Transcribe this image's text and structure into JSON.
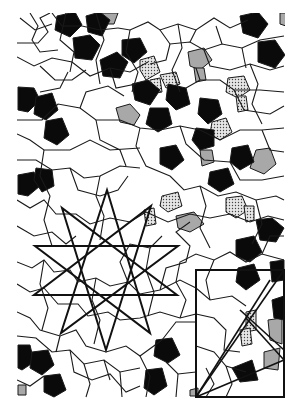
{
  "figure": {
    "kind": "geometric-tiling-diagram",
    "bounds": {
      "x": 17,
      "y": 13,
      "width": 267,
      "height": 384
    },
    "colors": {
      "background": "#ffffff",
      "line": "#1a1a1a",
      "pentagon_fill": "#0a0a0a",
      "gray_fill": "#a8a8a8",
      "dot_fill": "#e6e6e6",
      "dot": "#444444"
    },
    "black_pentagons": [
      [
        [
          57,
          16
        ],
        [
          75,
          12
        ],
        [
          82,
          25
        ],
        [
          70,
          37
        ],
        [
          55,
          30
        ]
      ],
      [
        [
          73,
          38
        ],
        [
          90,
          35
        ],
        [
          100,
          45
        ],
        [
          92,
          60
        ],
        [
          75,
          58
        ]
      ],
      [
        [
          100,
          60
        ],
        [
          117,
          52
        ],
        [
          128,
          62
        ],
        [
          120,
          78
        ],
        [
          103,
          76
        ]
      ],
      [
        [
          122,
          40
        ],
        [
          140,
          38
        ],
        [
          147,
          52
        ],
        [
          134,
          63
        ],
        [
          122,
          55
        ]
      ],
      [
        [
          86,
          16
        ],
        [
          100,
          12
        ],
        [
          110,
          20
        ],
        [
          102,
          36
        ],
        [
          88,
          32
        ]
      ],
      [
        [
          240,
          16
        ],
        [
          258,
          12
        ],
        [
          268,
          24
        ],
        [
          258,
          38
        ],
        [
          243,
          33
        ]
      ],
      [
        [
          258,
          42
        ],
        [
          275,
          40
        ],
        [
          285,
          55
        ],
        [
          275,
          68
        ],
        [
          258,
          62
        ]
      ],
      [
        [
          18,
          87
        ],
        [
          34,
          88
        ],
        [
          40,
          100
        ],
        [
          28,
          112
        ],
        [
          18,
          110
        ]
      ],
      [
        [
          36,
          97
        ],
        [
          52,
          93
        ],
        [
          58,
          110
        ],
        [
          46,
          120
        ],
        [
          34,
          114
        ]
      ],
      [
        [
          46,
          121
        ],
        [
          62,
          118
        ],
        [
          69,
          135
        ],
        [
          57,
          145
        ],
        [
          44,
          138
        ]
      ],
      [
        [
          132,
          84
        ],
        [
          148,
          80
        ],
        [
          160,
          90
        ],
        [
          150,
          105
        ],
        [
          135,
          100
        ]
      ],
      [
        [
          168,
          84
        ],
        [
          186,
          88
        ],
        [
          190,
          104
        ],
        [
          176,
          110
        ],
        [
          166,
          100
        ]
      ],
      [
        [
          150,
          108
        ],
        [
          168,
          108
        ],
        [
          172,
          124
        ],
        [
          158,
          132
        ],
        [
          146,
          124
        ]
      ],
      [
        [
          160,
          148
        ],
        [
          176,
          145
        ],
        [
          184,
          160
        ],
        [
          172,
          170
        ],
        [
          160,
          164
        ]
      ],
      [
        [
          200,
          98
        ],
        [
          218,
          100
        ],
        [
          222,
          114
        ],
        [
          208,
          124
        ],
        [
          198,
          114
        ]
      ],
      [
        [
          196,
          128
        ],
        [
          214,
          130
        ],
        [
          214,
          146
        ],
        [
          200,
          150
        ],
        [
          192,
          140
        ]
      ],
      [
        [
          232,
          148
        ],
        [
          248,
          145
        ],
        [
          254,
          162
        ],
        [
          240,
          170
        ],
        [
          230,
          162
        ]
      ],
      [
        [
          210,
          172
        ],
        [
          228,
          168
        ],
        [
          234,
          184
        ],
        [
          220,
          192
        ],
        [
          208,
          184
        ]
      ],
      [
        [
          18,
          175
        ],
        [
          34,
          172
        ],
        [
          40,
          186
        ],
        [
          28,
          196
        ],
        [
          18,
          194
        ]
      ],
      [
        [
          36,
          168
        ],
        [
          52,
          170
        ],
        [
          54,
          186
        ],
        [
          42,
          192
        ],
        [
          34,
          180
        ]
      ],
      [
        [
          256,
          220
        ],
        [
          272,
          218
        ],
        [
          284,
          228
        ],
        [
          276,
          242
        ],
        [
          260,
          240
        ]
      ],
      [
        [
          236,
          240
        ],
        [
          254,
          236
        ],
        [
          262,
          252
        ],
        [
          250,
          262
        ],
        [
          236,
          256
        ]
      ],
      [
        [
          238,
          268
        ],
        [
          254,
          264
        ],
        [
          260,
          280
        ],
        [
          246,
          290
        ],
        [
          236,
          282
        ]
      ],
      [
        [
          270,
          262
        ],
        [
          284,
          260
        ],
        [
          284,
          280
        ],
        [
          272,
          282
        ]
      ],
      [
        [
          18,
          345
        ],
        [
          30,
          345
        ],
        [
          34,
          362
        ],
        [
          22,
          370
        ],
        [
          18,
          368
        ]
      ],
      [
        [
          32,
          352
        ],
        [
          48,
          350
        ],
        [
          54,
          365
        ],
        [
          42,
          375
        ],
        [
          30,
          368
        ]
      ],
      [
        [
          44,
          376
        ],
        [
          60,
          374
        ],
        [
          66,
          390
        ],
        [
          54,
          397
        ],
        [
          44,
          392
        ]
      ],
      [
        [
          156,
          340
        ],
        [
          172,
          338
        ],
        [
          180,
          355
        ],
        [
          168,
          363
        ],
        [
          154,
          356
        ]
      ],
      [
        [
          146,
          370
        ],
        [
          162,
          368
        ],
        [
          167,
          386
        ],
        [
          154,
          395
        ],
        [
          144,
          388
        ]
      ],
      [
        [
          272,
          300
        ],
        [
          284,
          296
        ],
        [
          284,
          320
        ],
        [
          274,
          318
        ]
      ],
      [
        [
          232,
          368
        ],
        [
          252,
          360
        ],
        [
          258,
          380
        ],
        [
          240,
          382
        ]
      ]
    ],
    "gray_tiles": [
      [
        [
          100,
          13
        ],
        [
          118,
          13
        ],
        [
          114,
          24
        ],
        [
          104,
          24
        ]
      ],
      [
        [
          116,
          108
        ],
        [
          130,
          104
        ],
        [
          140,
          115
        ],
        [
          134,
          125
        ],
        [
          120,
          122
        ]
      ],
      [
        [
          188,
          52
        ],
        [
          204,
          48
        ],
        [
          212,
          60
        ],
        [
          200,
          70
        ],
        [
          190,
          66
        ]
      ],
      [
        [
          194,
          68
        ],
        [
          204,
          68
        ],
        [
          206,
          80
        ],
        [
          196,
          82
        ]
      ],
      [
        [
          200,
          150
        ],
        [
          212,
          150
        ],
        [
          214,
          162
        ],
        [
          202,
          166
        ]
      ],
      [
        [
          256,
          150
        ],
        [
          270,
          148
        ],
        [
          276,
          164
        ],
        [
          264,
          174
        ],
        [
          250,
          168
        ]
      ],
      [
        [
          176,
          216
        ],
        [
          194,
          212
        ],
        [
          204,
          224
        ],
        [
          190,
          232
        ],
        [
          178,
          228
        ]
      ],
      [
        [
          268,
          320
        ],
        [
          282,
          318
        ],
        [
          282,
          344
        ],
        [
          270,
          340
        ]
      ],
      [
        [
          264,
          352
        ],
        [
          280,
          348
        ],
        [
          278,
          370
        ],
        [
          264,
          368
        ]
      ],
      [
        [
          18,
          385
        ],
        [
          26,
          385
        ],
        [
          26,
          395
        ],
        [
          18,
          395
        ]
      ],
      [
        [
          190,
          390
        ],
        [
          198,
          388
        ],
        [
          198,
          396
        ],
        [
          190,
          396
        ]
      ],
      [
        [
          280,
          13
        ],
        [
          286,
          13
        ],
        [
          286,
          26
        ],
        [
          280,
          24
        ]
      ]
    ],
    "dot_tiles": [
      [
        [
          140,
          60
        ],
        [
          154,
          56
        ],
        [
          160,
          72
        ],
        [
          146,
          80
        ],
        [
          140,
          70
        ]
      ],
      [
        [
          150,
          80
        ],
        [
          160,
          78
        ],
        [
          162,
          92
        ],
        [
          150,
          94
        ]
      ],
      [
        [
          160,
          75
        ],
        [
          176,
          72
        ],
        [
          180,
          84
        ],
        [
          166,
          88
        ]
      ],
      [
        [
          228,
          78
        ],
        [
          244,
          76
        ],
        [
          250,
          90
        ],
        [
          238,
          98
        ],
        [
          226,
          92
        ]
      ],
      [
        [
          236,
          96
        ],
        [
          246,
          96
        ],
        [
          248,
          110
        ],
        [
          238,
          112
        ]
      ],
      [
        [
          212,
          122
        ],
        [
          226,
          118
        ],
        [
          232,
          132
        ],
        [
          220,
          140
        ],
        [
          210,
          134
        ]
      ],
      [
        [
          162,
          196
        ],
        [
          178,
          192
        ],
        [
          182,
          206
        ],
        [
          168,
          212
        ],
        [
          160,
          206
        ]
      ],
      [
        [
          144,
          210
        ],
        [
          154,
          208
        ],
        [
          156,
          224
        ],
        [
          146,
          226
        ]
      ],
      [
        [
          226,
          198
        ],
        [
          242,
          196
        ],
        [
          248,
          210
        ],
        [
          236,
          218
        ],
        [
          226,
          212
        ]
      ],
      [
        [
          244,
          206
        ],
        [
          254,
          206
        ],
        [
          254,
          220
        ],
        [
          246,
          222
        ]
      ],
      [
        [
          246,
          312
        ],
        [
          256,
          310
        ],
        [
          256,
          330
        ],
        [
          246,
          332
        ]
      ],
      [
        [
          240,
          330
        ],
        [
          250,
          328
        ],
        [
          252,
          344
        ],
        [
          242,
          346
        ]
      ]
    ],
    "overlays": {
      "pentagram_upright": [
        [
          107,
          190
        ],
        [
          150,
          333
        ],
        [
          35,
          246
        ],
        [
          178,
          246
        ],
        [
          61,
          333
        ]
      ],
      "pentagram_inverted": [
        [
          106,
          350
        ],
        [
          62,
          208
        ],
        [
          177,
          295
        ],
        [
          34,
          295
        ],
        [
          151,
          206
        ]
      ],
      "rectangle": {
        "x": 196,
        "y": 270,
        "width": 88,
        "height": 127
      },
      "rectangle_diagonals": [
        [
          [
            196,
            397
          ],
          [
            284,
            270
          ]
        ],
        [
          [
            196,
            397
          ],
          [
            284,
            360
          ]
        ],
        [
          [
            246,
            318
          ],
          [
            284,
            360
          ]
        ],
        [
          [
            240,
            310
          ],
          [
            284,
            350
          ]
        ],
        [
          [
            196,
            397
          ],
          [
            270,
            280
          ]
        ]
      ]
    }
  }
}
